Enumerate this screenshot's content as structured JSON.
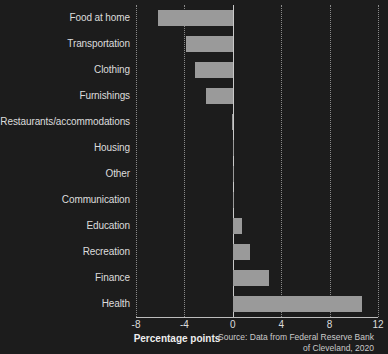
{
  "chart_data": {
    "type": "bar",
    "orientation": "horizontal",
    "title": "",
    "xlabel": "Percentage points",
    "ylabel": "",
    "xlim": [
      -8,
      12
    ],
    "xticks": [
      -8,
      -4,
      0,
      4,
      8,
      12
    ],
    "xtick_labels": [
      "-8",
      "-4",
      "0",
      "4",
      "8",
      "12"
    ],
    "grid": true,
    "grid_axis": "x",
    "legend": "none",
    "categories": [
      "Food at home",
      "Transportation",
      "Clothing",
      "Furnishings",
      "Restaurants/accommodations",
      "Housing",
      "Other",
      "Communication",
      "Education",
      "Recreation",
      "Finance",
      "Health"
    ],
    "values": [
      -6.2,
      -3.9,
      -3.1,
      -2.2,
      -0.1,
      0.0,
      0.05,
      0.1,
      0.8,
      1.4,
      3.0,
      10.7
    ],
    "source": "Source: Data from Federal Reserve Bank of Cleveland, 2020",
    "source_line1": "Source: Data from Federal Reserve Bank",
    "source_line2": "of Cleveland, 2020"
  },
  "style": {
    "background": "#1c1c1c",
    "bar_color": "#9a9a9a",
    "text_color": "#dcdcdc",
    "grid_color": "#8a8a8a",
    "axis_color": "#bdbdbd"
  }
}
